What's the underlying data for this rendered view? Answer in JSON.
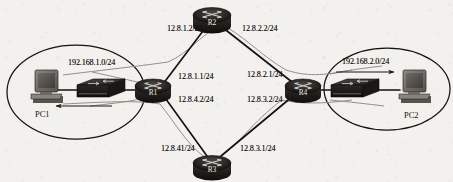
{
  "diagram": {
    "type": "network-topology",
    "background_color": "#f3f1ee",
    "link_color": "#141210",
    "flow_color": "#8d8881"
  },
  "routers": [
    {
      "id": "r2",
      "label": "R2",
      "x": 212,
      "y": 17
    },
    {
      "id": "r1",
      "label": "R1",
      "x": 153,
      "y": 88
    },
    {
      "id": "r4",
      "label": "R4",
      "x": 303,
      "y": 88
    },
    {
      "id": "r3",
      "label": "R3",
      "x": 212,
      "y": 167
    }
  ],
  "switches": [
    {
      "id": "sw1",
      "x": 101,
      "y": 90
    },
    {
      "id": "sw2",
      "x": 355,
      "y": 90
    }
  ],
  "hosts": [
    {
      "id": "pc1",
      "label": "PC1",
      "x": 44,
      "y": 86,
      "label_x": 35,
      "label_y": 112
    },
    {
      "id": "pc2",
      "label": "PC2",
      "x": 412,
      "y": 86,
      "label_x": 404,
      "label_y": 113
    }
  ],
  "clouds": [
    {
      "id": "lan-left",
      "cx": 76,
      "cy": 92,
      "rx": 69,
      "ry": 47
    },
    {
      "id": "lan-right",
      "cx": 387,
      "cy": 89,
      "rx": 63,
      "ry": 41
    }
  ],
  "interface_labels": [
    {
      "id": "r2-left",
      "text": "12.8.1.2/24",
      "x": 170,
      "y": 29
    },
    {
      "id": "r2-right",
      "text": "12.8.2.2/24",
      "x": 243,
      "y": 29
    },
    {
      "id": "r1-up",
      "text": "12.8.1.1/24",
      "x": 180,
      "y": 76
    },
    {
      "id": "r1-down",
      "text": "12.8.4.2/24",
      "x": 180,
      "y": 99
    },
    {
      "id": "r4-up",
      "text": "12.8.2.1/24",
      "x": 248,
      "y": 74
    },
    {
      "id": "r4-down",
      "text": "12.8.3.2/24",
      "x": 248,
      "y": 99
    },
    {
      "id": "r3-left",
      "text": "12.8.41/24",
      "x": 163,
      "y": 148
    },
    {
      "id": "r3-right",
      "text": "12.8.3.1/24",
      "x": 241,
      "y": 148
    }
  ],
  "subnet_labels": [
    {
      "id": "lan1",
      "text": "192.168.1.0/24",
      "x": 68,
      "y": 64
    },
    {
      "id": "lan2",
      "text": "192.168.2.0/24",
      "x": 342,
      "y": 63
    }
  ],
  "flow_arrows": [
    {
      "id": "flow-to-pc2",
      "direction": "right",
      "target": "PC2"
    },
    {
      "id": "flow-to-pc1",
      "direction": "left",
      "target": "PC1"
    }
  ],
  "links": [
    {
      "from": "R1",
      "to": "R2",
      "networks": [
        "12.8.1.1/24",
        "12.8.1.2/24"
      ]
    },
    {
      "from": "R2",
      "to": "R4",
      "networks": [
        "12.8.2.2/24",
        "12.8.2.1/24"
      ]
    },
    {
      "from": "R1",
      "to": "R3",
      "networks": [
        "12.8.4.2/24",
        "12.8.41/24"
      ]
    },
    {
      "from": "R3",
      "to": "R4",
      "networks": [
        "12.8.3.1/24",
        "12.8.3.2/24"
      ]
    },
    {
      "from": "PC1",
      "to": "R1",
      "networks": [
        "192.168.1.0/24"
      ]
    },
    {
      "from": "R4",
      "to": "PC2",
      "networks": [
        "192.168.2.0/24"
      ]
    }
  ]
}
